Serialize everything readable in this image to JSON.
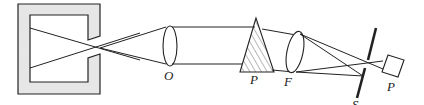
{
  "diagram": {
    "type": "optical-spectrometer-schematic",
    "labels": {
      "lens_O": "O",
      "prism": "P",
      "lens_F": "F",
      "slit": "S",
      "detector": "P"
    },
    "colors": {
      "stroke": "#222222",
      "housing_fill": "#e6e6e6",
      "prism_hatch": "#999999"
    }
  }
}
